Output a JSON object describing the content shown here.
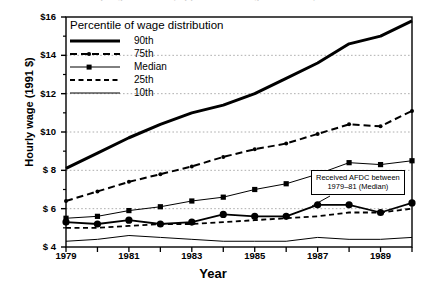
{
  "figure": {
    "title_clipped": "Hourly wages of women, by percentile of wage distribution, 1979-90",
    "ylabel": "Hourly wage (1991 $)",
    "xlabel": "Year"
  },
  "legend": {
    "title": "Percentile of wage distribution",
    "items": [
      {
        "label": "90th",
        "style": "thick-solid",
        "color": "#000000"
      },
      {
        "label": "75th",
        "style": "dashed-dot",
        "color": "#000000"
      },
      {
        "label": "Median",
        "style": "thin-square",
        "color": "#000000"
      },
      {
        "label": "25th",
        "style": "dashed",
        "color": "#000000"
      },
      {
        "label": "10th",
        "style": "thin-solid",
        "color": "#000000"
      }
    ]
  },
  "annotation": {
    "line1": "Received AFDC between",
    "line2": "1979–81 (Median)"
  },
  "axes": {
    "y_ticks": [
      "$16",
      "$14",
      "$12",
      "$10",
      "$ 8",
      "$ 6",
      "$ 4"
    ],
    "y_values": [
      16,
      14,
      12,
      10,
      8,
      6,
      4
    ],
    "x_ticks": [
      "1979",
      "1981",
      "1983",
      "1985",
      "1987",
      "1989"
    ],
    "x_tick_values": [
      1979,
      1981,
      1983,
      1985,
      1987,
      1989
    ],
    "x_all_ticks": [
      1979,
      1980,
      1981,
      1982,
      1983,
      1984,
      1985,
      1986,
      1987,
      1988,
      1989,
      1990
    ]
  },
  "chart_data": {
    "type": "line",
    "title": "Hourly wages of women, by percentile of wage distribution, 1979-90",
    "xlabel": "Year",
    "ylabel": "Hourly wage (1991 $)",
    "xlim": [
      1979,
      1990
    ],
    "ylim": [
      4,
      16
    ],
    "grid": "horizontal-dotted-at-6-8-10-12-14",
    "legend_position": "upper-left-inside",
    "x": [
      1979,
      1980,
      1981,
      1982,
      1983,
      1984,
      1985,
      1986,
      1987,
      1988,
      1989,
      1990
    ],
    "series": [
      {
        "name": "90th",
        "values": [
          8.1,
          8.9,
          9.7,
          10.4,
          11.0,
          11.4,
          12.0,
          12.8,
          13.6,
          14.6,
          15.0,
          15.8
        ],
        "style": "thick-solid",
        "markers": "none"
      },
      {
        "name": "75th",
        "values": [
          6.4,
          6.9,
          7.4,
          7.8,
          8.2,
          8.7,
          9.1,
          9.4,
          9.9,
          10.4,
          10.3,
          11.1
        ],
        "style": "dashed-dot",
        "markers": "small-circle"
      },
      {
        "name": "Median",
        "values": [
          5.5,
          5.6,
          5.9,
          6.1,
          6.4,
          6.6,
          7.0,
          7.3,
          7.8,
          8.4,
          8.3,
          8.5
        ],
        "style": "thin-square",
        "markers": "square"
      },
      {
        "name": "25th",
        "values": [
          5.0,
          5.0,
          5.1,
          5.2,
          5.2,
          5.3,
          5.4,
          5.5,
          5.6,
          5.8,
          5.8,
          6.0
        ],
        "style": "dashed",
        "markers": "none"
      },
      {
        "name": "10th",
        "values": [
          4.3,
          4.4,
          4.6,
          4.5,
          4.4,
          4.3,
          4.3,
          4.3,
          4.5,
          4.4,
          4.4,
          4.5
        ],
        "style": "thin-solid",
        "markers": "none"
      },
      {
        "name": "Received AFDC between 1979-81 (Median)",
        "values": [
          5.3,
          5.2,
          5.4,
          5.2,
          5.3,
          5.7,
          5.6,
          5.6,
          6.2,
          6.2,
          5.8,
          6.3
        ],
        "style": "medium-solid",
        "markers": "large-circle"
      }
    ]
  }
}
